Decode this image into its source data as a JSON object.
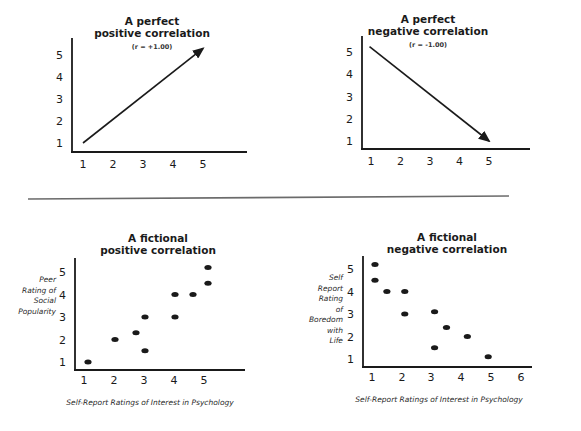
{
  "colors": {
    "ink": "#1a1a1a",
    "divider": "#6b6b6b",
    "background": "#ffffff"
  },
  "chart_data": [
    {
      "id": "perfect-positive",
      "type": "line",
      "title": "A perfect positive correlation",
      "title_lines": [
        "A perfect",
        "positive correlation"
      ],
      "subtitle": "(r = +1.00)",
      "xlabel": "",
      "ylabel": "",
      "x_ticks": [
        1,
        2,
        3,
        4,
        5
      ],
      "y_ticks": [
        1,
        2,
        3,
        4,
        5
      ],
      "grid": false,
      "arrow": {
        "from": [
          1,
          1
        ],
        "to": [
          5,
          5.3
        ]
      },
      "frame": {
        "ox": 72,
        "oy": 152,
        "x_end": 247,
        "y_top": 38,
        "x0px": 83,
        "xstep": 30,
        "y0px": 143,
        "ystep": 22,
        "title_cx": 152,
        "title_y": [
          25,
          37
        ],
        "subtitle_y": 49
      }
    },
    {
      "id": "perfect-negative",
      "type": "line",
      "title": "A perfect negative correlation",
      "title_lines": [
        "A perfect",
        "negative correlation"
      ],
      "subtitle": "(r = -1.00)",
      "xlabel": "",
      "ylabel": "",
      "x_ticks": [
        1,
        2,
        3,
        4,
        5
      ],
      "y_ticks": [
        1,
        2,
        3,
        4,
        5
      ],
      "grid": false,
      "arrow": {
        "from": [
          0.95,
          5.25
        ],
        "to": [
          5,
          1
        ]
      },
      "frame": {
        "ox": 362,
        "oy": 149,
        "x_end": 530,
        "y_top": 36,
        "x0px": 371,
        "xstep": 29.5,
        "y0px": 141,
        "ystep": 22.2,
        "title_cx": 428,
        "title_y": [
          23,
          35
        ],
        "subtitle_y": 47
      }
    },
    {
      "id": "fictional-positive",
      "type": "scatter",
      "title": "A fictional positive correlation",
      "title_lines": [
        "A fictional",
        "positive correlation"
      ],
      "xlabel": "Self-Report Ratings of Interest in Psychology",
      "ylabel": "Peer Rating of Social Popularity",
      "ylabel_lines": [
        "Peer",
        "Rating of",
        "Social",
        "Popularity"
      ],
      "x_ticks": [
        1,
        2,
        3,
        4,
        5
      ],
      "y_ticks": [
        1,
        2,
        3,
        4,
        5
      ],
      "grid": false,
      "points": [
        {
          "x": 1.0,
          "y": 1.0
        },
        {
          "x": 1.9,
          "y": 2.0
        },
        {
          "x": 2.6,
          "y": 2.3
        },
        {
          "x": 2.9,
          "y": 3.0
        },
        {
          "x": 2.9,
          "y": 1.5
        },
        {
          "x": 3.9,
          "y": 4.0
        },
        {
          "x": 3.9,
          "y": 3.0
        },
        {
          "x": 4.5,
          "y": 4.0
        },
        {
          "x": 5.0,
          "y": 5.2
        },
        {
          "x": 5.0,
          "y": 4.5
        }
      ],
      "frame": {
        "ox": 75,
        "oy": 370,
        "x_end": 245,
        "y_top": 258,
        "x0px": 88,
        "xstep": 30,
        "y0px": 362,
        "ystep": 22.5,
        "xtick_px": [
          84,
          114,
          144,
          174,
          204
        ],
        "xtick_y": 384,
        "title_cx": 158,
        "title_y": [
          242,
          254
        ],
        "xlabel_cx": 150,
        "xlabel_y": 405,
        "ylabel_rx": 56,
        "ylabel_y0": 282,
        "ylabel_dy": 10.5
      }
    },
    {
      "id": "fictional-negative",
      "type": "scatter",
      "title": "A fictional negative correlation",
      "title_lines": [
        "A fictional",
        "negative correlation"
      ],
      "xlabel": "Self-Report Ratings of Interest in Psychology",
      "ylabel": "Self Report Rating of Boredom with Life",
      "ylabel_lines": [
        "Self",
        "Report",
        "Rating",
        "of",
        "Boredom",
        "with",
        "Life"
      ],
      "x_ticks": [
        1,
        2,
        3,
        4,
        5,
        6
      ],
      "y_ticks": [
        1,
        2,
        3,
        4,
        5
      ],
      "grid": false,
      "points": [
        {
          "x": 1.1,
          "y": 5.2
        },
        {
          "x": 1.1,
          "y": 4.5
        },
        {
          "x": 1.5,
          "y": 4.0
        },
        {
          "x": 2.1,
          "y": 4.0
        },
        {
          "x": 2.1,
          "y": 3.0
        },
        {
          "x": 3.1,
          "y": 3.1
        },
        {
          "x": 3.5,
          "y": 2.4
        },
        {
          "x": 4.2,
          "y": 2.0
        },
        {
          "x": 3.1,
          "y": 1.5
        },
        {
          "x": 4.9,
          "y": 1.1
        }
      ],
      "frame": {
        "ox": 363,
        "oy": 367,
        "x_end": 532,
        "y_top": 256,
        "x0px": 372,
        "xstep": 29.8,
        "y0px": 359,
        "ystep": 22.5,
        "xtick_px": [
          372,
          402,
          431,
          461,
          491,
          521
        ],
        "xtick_y": 381,
        "title_cx": 447,
        "title_y": [
          241,
          253
        ],
        "xlabel_cx": 439,
        "xlabel_y": 402,
        "ylabel_rx": 343,
        "ylabel_y0": 280,
        "ylabel_dy": 10.5
      }
    }
  ],
  "divider": {
    "x1": 28,
    "y1": 199,
    "x2": 509,
    "y2": 196
  }
}
